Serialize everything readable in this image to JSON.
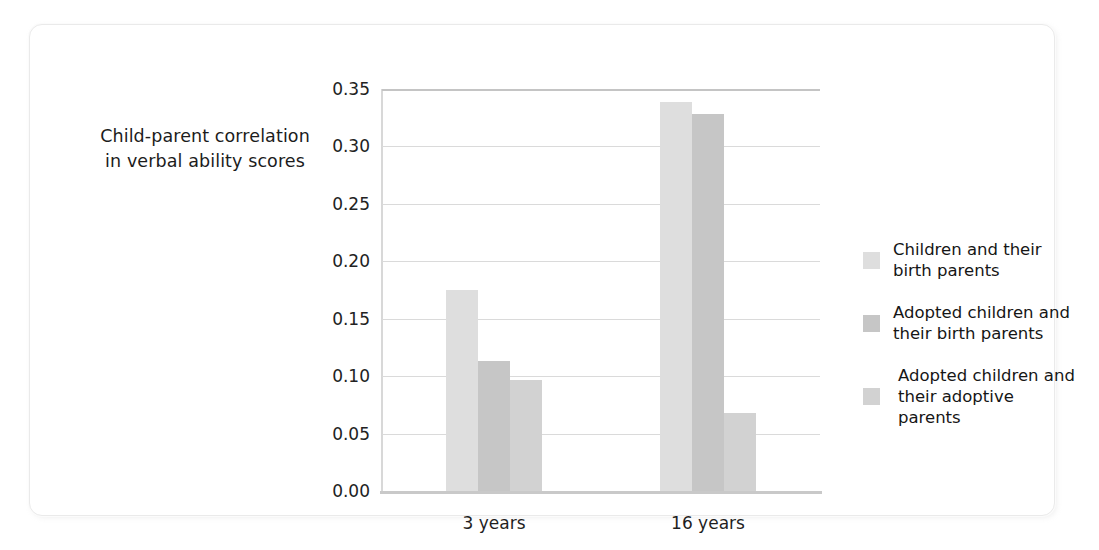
{
  "chart_data": {
    "type": "bar",
    "title": "",
    "subtitle": "",
    "xlabel": "",
    "ylabel": "Child-parent correlation in verbal ability scores",
    "categories": [
      "3 years",
      "16 years"
    ],
    "series": [
      {
        "name": "Children and their birth parents",
        "values": [
          0.175,
          0.339
        ],
        "color": "#dedede"
      },
      {
        "name": "Adopted children and their birth parents",
        "values": [
          0.113,
          0.328
        ],
        "color": "#c6c6c6"
      },
      {
        "name": "Adopted children and their adoptive parents",
        "values": [
          0.097,
          0.068
        ],
        "color": "#d2d2d2"
      }
    ],
    "ylim": [
      0.0,
      0.35
    ],
    "ytick_values": [
      0.0,
      0.05,
      0.1,
      0.15,
      0.2,
      0.25,
      0.3,
      0.35
    ],
    "ytick_labels": [
      "0.00",
      "0.05",
      "0.10",
      "0.15",
      "0.20",
      "0.25",
      "0.30",
      "0.35"
    ],
    "grid": true,
    "grid_axis": "y",
    "legend_position": "right"
  },
  "axis_title": {
    "line1": "Child-parent correlation",
    "line2": "in verbal ability scores"
  },
  "legend": {
    "entries": [
      {
        "line1": "Children and their",
        "line2": "birth parents",
        "indented": false
      },
      {
        "line1": "Adopted children and",
        "line2": "their birth parents",
        "indented": false
      },
      {
        "line1": "Adopted children and",
        "line2": "their adoptive parents",
        "indented": true
      }
    ]
  }
}
